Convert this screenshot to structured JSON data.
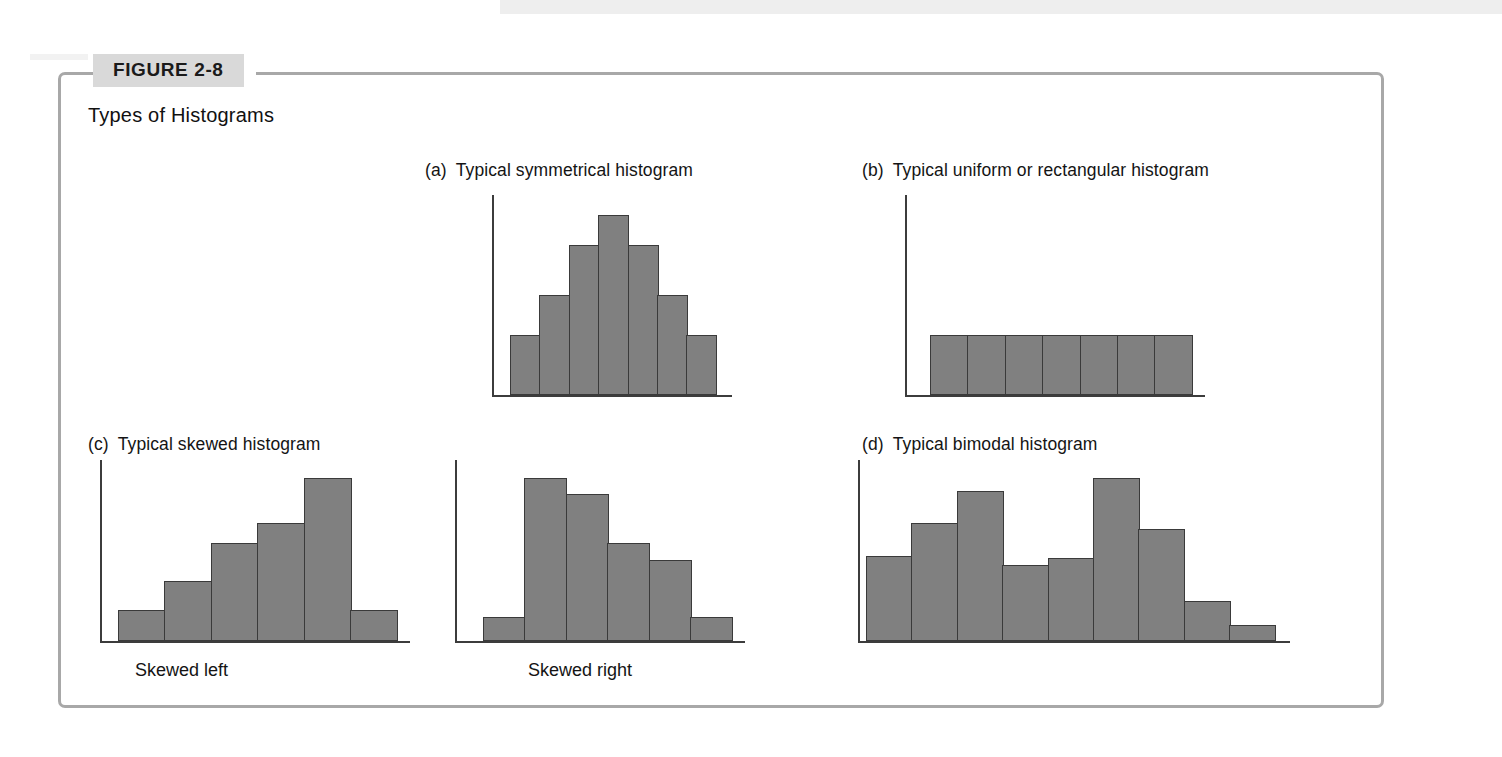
{
  "figure": {
    "tag": "FIGURE 2-8",
    "caption": "Types of Histograms",
    "frame_color": "#a8a8a8",
    "tag_bg_color": "#d9d9d9",
    "bar_fill_color": "#808080",
    "bar_stroke_color": "#3a3a3a"
  },
  "panels": [
    {
      "key": "a",
      "marker": "(a)",
      "title": "Typical symmetrical histogram",
      "sub_label": ""
    },
    {
      "key": "b",
      "marker": "(b)",
      "title": "Typical uniform or rectangular histogram",
      "sub_label": ""
    },
    {
      "key": "c",
      "marker": "(c)",
      "title": "Typical skewed histogram",
      "sub_label": "Skewed left"
    },
    {
      "key": "c2",
      "marker": "",
      "title": "",
      "sub_label": "Skewed right"
    },
    {
      "key": "d",
      "marker": "(d)",
      "title": "Typical bimodal histogram",
      "sub_label": ""
    }
  ],
  "chart_data": [
    {
      "type": "bar",
      "title": "(a)  Typical symmetrical histogram",
      "xlabel": "",
      "ylabel": "",
      "grid": false,
      "legend": false,
      "ylim": [
        0,
        10
      ],
      "categories": [
        "1",
        "2",
        "3",
        "4",
        "5",
        "6",
        "7"
      ],
      "values": [
        3,
        5,
        7.5,
        9,
        7.5,
        5,
        3
      ]
    },
    {
      "type": "bar",
      "title": "(b)  Typical uniform or rectangular histogram",
      "xlabel": "",
      "ylabel": "",
      "grid": false,
      "legend": false,
      "ylim": [
        0,
        10
      ],
      "categories": [
        "1",
        "2",
        "3",
        "4",
        "5",
        "6",
        "7"
      ],
      "values": [
        3,
        3,
        3,
        3,
        3,
        3,
        3
      ]
    },
    {
      "type": "bar",
      "title": "(c)  Typical skewed histogram — Skewed left",
      "xlabel": "Skewed left",
      "ylabel": "",
      "grid": false,
      "legend": false,
      "ylim": [
        0,
        10
      ],
      "categories": [
        "1",
        "2",
        "3",
        "4",
        "5",
        "6"
      ],
      "values": [
        1.7,
        3.3,
        5.4,
        6.5,
        9,
        1.7
      ]
    },
    {
      "type": "bar",
      "title": "(c)  Typical skewed histogram — Skewed right",
      "xlabel": "Skewed right",
      "ylabel": "",
      "grid": false,
      "legend": false,
      "ylim": [
        0,
        10
      ],
      "categories": [
        "1",
        "2",
        "3",
        "4",
        "5",
        "6"
      ],
      "values": [
        1.3,
        9,
        8.1,
        5.4,
        4.5,
        1.3
      ]
    },
    {
      "type": "bar",
      "title": "(d)  Typical bimodal histogram",
      "xlabel": "",
      "ylabel": "",
      "grid": false,
      "legend": false,
      "ylim": [
        0,
        10
      ],
      "categories": [
        "1",
        "2",
        "3",
        "4",
        "5",
        "6",
        "7",
        "8",
        "9"
      ],
      "values": [
        4.7,
        6.5,
        8.3,
        4.2,
        4.6,
        9,
        6.2,
        2.2,
        0.9
      ]
    }
  ]
}
